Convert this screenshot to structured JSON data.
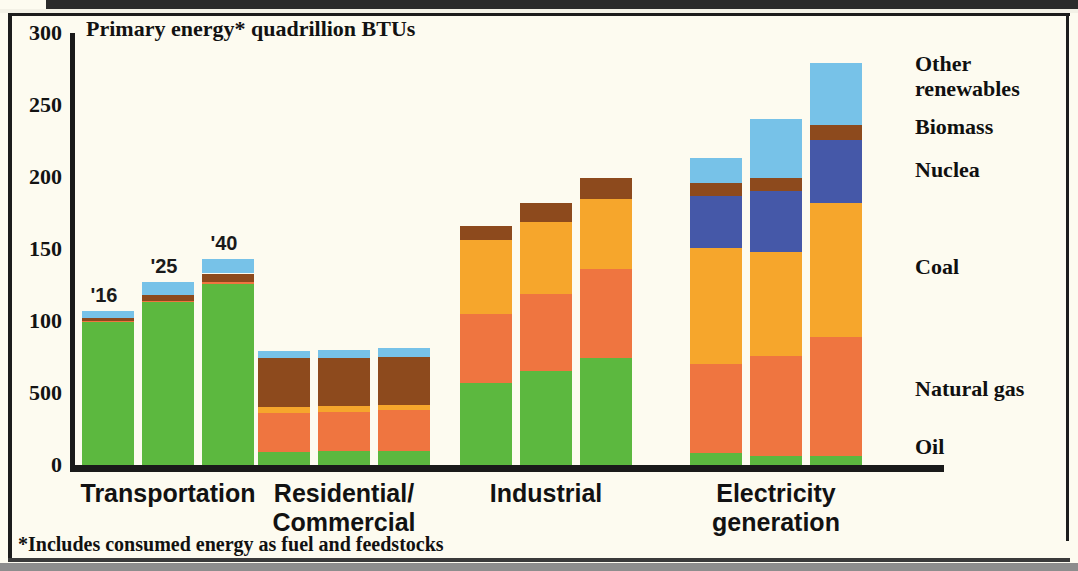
{
  "chart_data": {
    "type": "bar",
    "subtype": "stacked-grouped-column",
    "title": "Primary energy* quadrillion BTUs",
    "footnote": "*Includes consumed energy as fuel and feedstocks",
    "xlabel": "",
    "ylabel": "",
    "ylim": [
      0,
      300
    ],
    "grid": false,
    "ytick_labels": [
      "300",
      "250",
      "200",
      "150",
      "100",
      "500",
      "0"
    ],
    "ytick_values": [
      300,
      250,
      200,
      150,
      100,
      50,
      0
    ],
    "legend_position": "right",
    "categories": [
      "Transportation",
      "Residential/\nCommercial",
      "Industrial",
      "Electricity\ngeneration"
    ],
    "series_order": [
      "Oil",
      "Natural gas",
      "Coal",
      "Nuclear",
      "Biomass",
      "Other renewables"
    ],
    "series_colors": {
      "Oil": "#5cb83f",
      "Natural gas": "#ef7540",
      "Coal": "#f6a62c",
      "Nuclear": "#4558a8",
      "Biomass": "#8d4a1d",
      "Other renewables": "#77c2e8"
    },
    "legend": [
      {
        "name": "Other renewables",
        "label": "Other\nrenewables",
        "color": "#77c2e8"
      },
      {
        "name": "Biomass",
        "label": "Biomass",
        "color": "#8d4a1d"
      },
      {
        "name": "Nuclear",
        "label": "Nuclea",
        "color": "#4558a8"
      },
      {
        "name": "Coal",
        "label": "Coal",
        "color": "#f6a62c"
      },
      {
        "name": "Natural gas",
        "label": "Natural gas",
        "color": "#ef7540"
      },
      {
        "name": "Oil",
        "label": "Oil",
        "color": "#5cb83f"
      }
    ],
    "year_labels": [
      "'16",
      "'25",
      "'40"
    ],
    "groups": [
      {
        "category": "Transportation",
        "bars": [
          {
            "year": "'16",
            "total": 107,
            "segments": [
              {
                "name": "Oil",
                "value": 99
              },
              {
                "name": "Natural gas",
                "value": 1
              },
              {
                "name": "Coal",
                "value": 0
              },
              {
                "name": "Nuclear",
                "value": 0
              },
              {
                "name": "Biomass",
                "value": 2
              },
              {
                "name": "Other renewables",
                "value": 5
              }
            ]
          },
          {
            "year": "'25",
            "total": 127,
            "segments": [
              {
                "name": "Oil",
                "value": 113
              },
              {
                "name": "Natural gas",
                "value": 1
              },
              {
                "name": "Coal",
                "value": 0
              },
              {
                "name": "Nuclear",
                "value": 0
              },
              {
                "name": "Biomass",
                "value": 4
              },
              {
                "name": "Other renewables",
                "value": 9
              }
            ]
          },
          {
            "year": "'40",
            "total": 143,
            "segments": [
              {
                "name": "Oil",
                "value": 126
              },
              {
                "name": "Natural gas",
                "value": 1
              },
              {
                "name": "Coal",
                "value": 0
              },
              {
                "name": "Nuclear",
                "value": 0
              },
              {
                "name": "Biomass",
                "value": 6
              },
              {
                "name": "Other renewables",
                "value": 10
              }
            ]
          }
        ]
      },
      {
        "category": "Residential/Commercial",
        "bars": [
          {
            "year": "'16",
            "total": 79,
            "segments": [
              {
                "name": "Oil",
                "value": 9
              },
              {
                "name": "Natural gas",
                "value": 27
              },
              {
                "name": "Coal",
                "value": 4
              },
              {
                "name": "Nuclear",
                "value": 0
              },
              {
                "name": "Biomass",
                "value": 34
              },
              {
                "name": "Other renewables",
                "value": 5
              }
            ]
          },
          {
            "year": "'25",
            "total": 80,
            "segments": [
              {
                "name": "Oil",
                "value": 10
              },
              {
                "name": "Natural gas",
                "value": 27
              },
              {
                "name": "Coal",
                "value": 4
              },
              {
                "name": "Nuclear",
                "value": 0
              },
              {
                "name": "Biomass",
                "value": 33
              },
              {
                "name": "Other renewables",
                "value": 6
              }
            ]
          },
          {
            "year": "'40",
            "total": 81,
            "segments": [
              {
                "name": "Oil",
                "value": 10
              },
              {
                "name": "Natural gas",
                "value": 28
              },
              {
                "name": "Coal",
                "value": 4
              },
              {
                "name": "Nuclear",
                "value": 0
              },
              {
                "name": "Biomass",
                "value": 33
              },
              {
                "name": "Other renewables",
                "value": 6
              }
            ]
          }
        ]
      },
      {
        "category": "Industrial",
        "bars": [
          {
            "year": "'16",
            "total": 166,
            "segments": [
              {
                "name": "Oil",
                "value": 57
              },
              {
                "name": "Natural gas",
                "value": 48
              },
              {
                "name": "Coal",
                "value": 51
              },
              {
                "name": "Nuclear",
                "value": 0
              },
              {
                "name": "Biomass",
                "value": 10
              },
              {
                "name": "Other renewables",
                "value": 0
              }
            ]
          },
          {
            "year": "'25",
            "total": 182,
            "segments": [
              {
                "name": "Oil",
                "value": 65
              },
              {
                "name": "Natural gas",
                "value": 54
              },
              {
                "name": "Coal",
                "value": 50
              },
              {
                "name": "Nuclear",
                "value": 0
              },
              {
                "name": "Biomass",
                "value": 13
              },
              {
                "name": "Other renewables",
                "value": 0
              }
            ]
          },
          {
            "year": "'40",
            "total": 199,
            "segments": [
              {
                "name": "Oil",
                "value": 74
              },
              {
                "name": "Natural gas",
                "value": 62
              },
              {
                "name": "Coal",
                "value": 49
              },
              {
                "name": "Nuclear",
                "value": 0
              },
              {
                "name": "Biomass",
                "value": 14
              },
              {
                "name": "Other renewables",
                "value": 0
              }
            ]
          }
        ]
      },
      {
        "category": "Electricity generation",
        "bars": [
          {
            "year": "'16",
            "total": 213,
            "segments": [
              {
                "name": "Oil",
                "value": 8
              },
              {
                "name": "Natural gas",
                "value": 62
              },
              {
                "name": "Coal",
                "value": 81
              },
              {
                "name": "Nuclear",
                "value": 36
              },
              {
                "name": "Biomass",
                "value": 9
              },
              {
                "name": "Other renewables",
                "value": 17
              }
            ]
          },
          {
            "year": "'25",
            "total": 240,
            "segments": [
              {
                "name": "Oil",
                "value": 6
              },
              {
                "name": "Natural gas",
                "value": 70
              },
              {
                "name": "Coal",
                "value": 72
              },
              {
                "name": "Nuclear",
                "value": 42
              },
              {
                "name": "Biomass",
                "value": 9
              },
              {
                "name": "Other renewables",
                "value": 41
              }
            ]
          },
          {
            "year": "'40",
            "total": 279,
            "segments": [
              {
                "name": "Oil",
                "value": 6
              },
              {
                "name": "Natural gas",
                "value": 83
              },
              {
                "name": "Coal",
                "value": 93
              },
              {
                "name": "Nuclear",
                "value": 44
              },
              {
                "name": "Biomass",
                "value": 10
              },
              {
                "name": "Other renewables",
                "value": 43
              }
            ]
          }
        ]
      }
    ]
  }
}
